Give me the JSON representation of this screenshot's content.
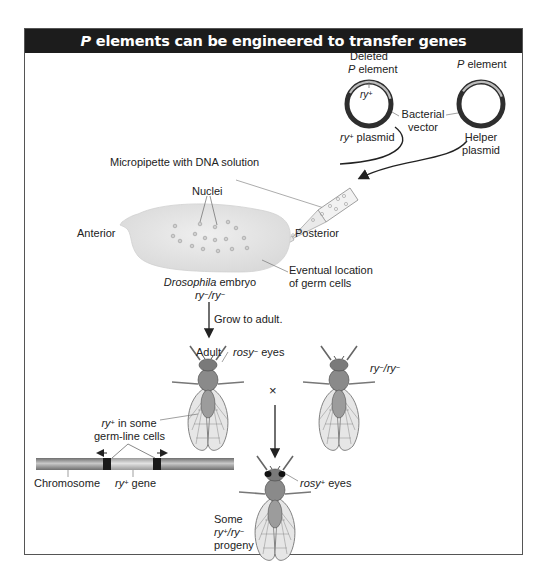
{
  "title": {
    "italic_prefix": "P",
    "text": " elements can be engineered to transfer genes"
  },
  "plasmids": {
    "deleted_p": {
      "line1": "Deleted",
      "line2_italic": "P",
      "line2": " element",
      "insert_italic": "ry",
      "insert_sup": "+",
      "name_italic": "ry",
      "name_sup": "+",
      "name": " plasmid"
    },
    "helper": {
      "top_italic": "P",
      "top": " element",
      "name_line1": "Helper",
      "name_line2": "plasmid"
    },
    "bacterial_vector": {
      "line1": "Bacterial",
      "line2": "vector"
    }
  },
  "injection": {
    "micropipette": "Micropipette with DNA solution",
    "nuclei": "Nuclei",
    "anterior": "Anterior",
    "posterior": "Posterior",
    "germ_cells_line1": "Eventual location",
    "germ_cells_line2": "of germ cells",
    "embryo_italic": "Drosophila",
    "embryo": " embryo",
    "embryo_genotype": {
      "a": "ry",
      "a_sup": "−",
      "sep": "/",
      "b": "ry",
      "b_sup": "−"
    }
  },
  "development": {
    "grow": "Grow to adult.",
    "adult": "Adult",
    "rosy_minus_italic": "rosy",
    "rosy_minus_sup": "−",
    "rosy_minus": " eyes",
    "cross_symbol": "×",
    "mate_genotype": {
      "a": "ry",
      "a_sup": "−",
      "sep": "/",
      "b": "ry",
      "b_sup": "−"
    }
  },
  "chromosome": {
    "ry_italic": "ry",
    "ry_sup": "+",
    "in_some": "  in some",
    "germline": "germ-line cells",
    "chromosome_label": "Chromosome",
    "gene_italic": "ry",
    "gene_sup": "+",
    "gene": " gene"
  },
  "progeny": {
    "rosy_plus_italic": "rosy",
    "rosy_plus_sup": "+",
    "rosy_plus": " eyes",
    "some": "Some",
    "genotype": {
      "a": "ry",
      "a_sup": "+",
      "sep": "/",
      "b": "ry",
      "b_sup": "−"
    },
    "progeny": "progeny"
  },
  "colors": {
    "header_bg": "#1c1c1c",
    "frame": "#555555",
    "embryo_fill": "#e4e4e4",
    "plasmid_ring": "#3a3a3a",
    "chromosome": "#8a8a8a",
    "insert_band": "#1a1a1a"
  }
}
